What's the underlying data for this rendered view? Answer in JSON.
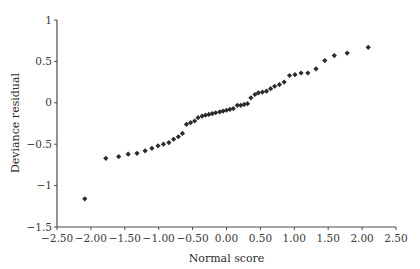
{
  "chart_data": {
    "type": "scatter",
    "title": "",
    "xlabel": "Normal score",
    "ylabel": "Deviance residual",
    "xlim": [
      -2.5,
      2.5
    ],
    "ylim": [
      -1.5,
      1
    ],
    "xticks": [
      "-2.50",
      "-2.00",
      "-1.50",
      "-1.00",
      "-0.50",
      "0.00",
      "0.50",
      "1.00",
      "1.50",
      "2.00",
      "2.50"
    ],
    "yticks": [
      "1",
      "0.5",
      "0",
      "-0.5",
      "-1",
      "-1.5"
    ],
    "grid": false,
    "legend": null,
    "marker": "diamond",
    "marker_color": "#2b2b2b",
    "series": [
      {
        "name": "Deviance residual vs normal score",
        "points": [
          [
            -2.09,
            -1.16
          ],
          [
            -1.78,
            -0.67
          ],
          [
            -1.59,
            -0.65
          ],
          [
            -1.45,
            -0.62
          ],
          [
            -1.32,
            -0.61
          ],
          [
            -1.2,
            -0.58
          ],
          [
            -1.1,
            -0.55
          ],
          [
            -1.01,
            -0.52
          ],
          [
            -0.93,
            -0.5
          ],
          [
            -0.85,
            -0.48
          ],
          [
            -0.78,
            -0.44
          ],
          [
            -0.71,
            -0.41
          ],
          [
            -0.65,
            -0.37
          ],
          [
            -0.59,
            -0.26
          ],
          [
            -0.53,
            -0.24
          ],
          [
            -0.47,
            -0.22
          ],
          [
            -0.42,
            -0.18
          ],
          [
            -0.36,
            -0.16
          ],
          [
            -0.31,
            -0.15
          ],
          [
            -0.26,
            -0.14
          ],
          [
            -0.21,
            -0.13
          ],
          [
            -0.16,
            -0.12
          ],
          [
            -0.1,
            -0.11
          ],
          [
            -0.05,
            -0.1
          ],
          [
            0.0,
            -0.09
          ],
          [
            0.05,
            -0.08
          ],
          [
            0.1,
            -0.07
          ],
          [
            0.16,
            -0.03
          ],
          [
            0.21,
            -0.03
          ],
          [
            0.26,
            -0.02
          ],
          [
            0.31,
            -0.01
          ],
          [
            0.36,
            0.06
          ],
          [
            0.42,
            0.1
          ],
          [
            0.47,
            0.12
          ],
          [
            0.53,
            0.13
          ],
          [
            0.59,
            0.14
          ],
          [
            0.65,
            0.17
          ],
          [
            0.71,
            0.2
          ],
          [
            0.78,
            0.22
          ],
          [
            0.85,
            0.25
          ],
          [
            0.93,
            0.33
          ],
          [
            1.01,
            0.34
          ],
          [
            1.1,
            0.36
          ],
          [
            1.2,
            0.36
          ],
          [
            1.32,
            0.41
          ],
          [
            1.45,
            0.51
          ],
          [
            1.59,
            0.57
          ],
          [
            1.78,
            0.6
          ],
          [
            2.09,
            0.67
          ]
        ]
      }
    ],
    "colors": {
      "axis": "#4a4a4a",
      "marker": "#2b2b2b",
      "text": "#333333",
      "background": "#ffffff"
    }
  }
}
